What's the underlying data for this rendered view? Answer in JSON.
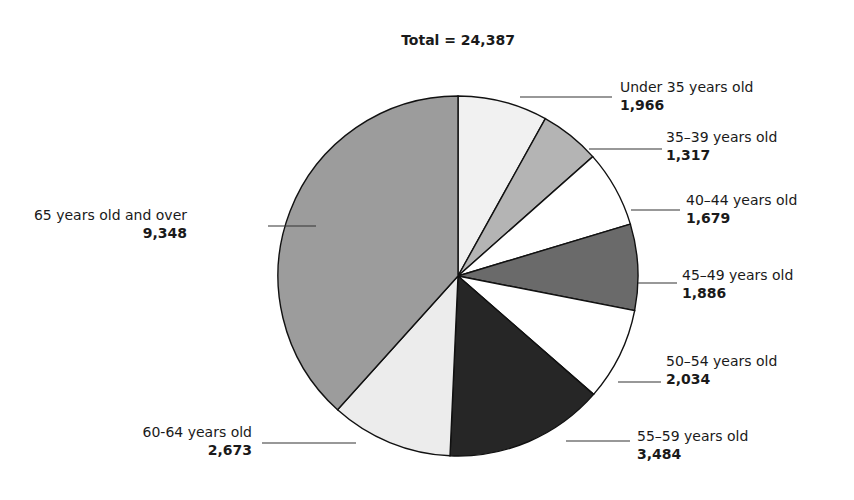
{
  "chart_data": {
    "type": "pie",
    "title": "Total = 24,387",
    "total": 24387,
    "start_angle": "12 o'clock",
    "direction": "clockwise",
    "categories": [
      "Under 35 years old",
      "35–39 years old",
      "40–44 years old",
      "45–49 years old",
      "50–54 years old",
      "55–59 years old",
      "60-64 years old",
      "65 years old and over"
    ],
    "values": [
      1966,
      1317,
      1679,
      1886,
      2034,
      3484,
      2673,
      9348
    ],
    "value_labels": [
      "1,966",
      "1,317",
      "1,679",
      "1,886",
      "2,034",
      "3,484",
      "2,673",
      "9,348"
    ],
    "colors": [
      "#f1f1f1",
      "#b4b4b4",
      "#ffffff",
      "#6a6a6a",
      "#ffffff",
      "#262626",
      "#ececec",
      "#9c9c9c"
    ],
    "legend": "none (leader-line labels)"
  },
  "title": "Total = 24,387",
  "labels": [
    {
      "name": "Under 35 years old",
      "value": "1,966"
    },
    {
      "name": "35–39 years old",
      "value": "1,317"
    },
    {
      "name": "40–44 years old",
      "value": "1,679"
    },
    {
      "name": "45–49 years old",
      "value": "1,886"
    },
    {
      "name": "50–54 years old",
      "value": "2,034"
    },
    {
      "name": "55–59 years old",
      "value": "3,484"
    },
    {
      "name": "60-64 years old",
      "value": "2,673"
    },
    {
      "name": "65 years old and over",
      "value": "9,348"
    }
  ]
}
